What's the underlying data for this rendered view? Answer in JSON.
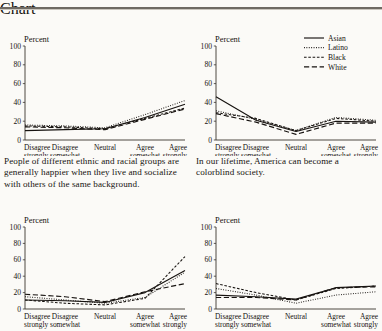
{
  "axis": {
    "y_label": "Percent",
    "y_ticks": [
      0,
      20,
      40,
      60,
      80,
      100
    ],
    "x_ticks": [
      {
        "line1": "Disagree",
        "line2": "strongly"
      },
      {
        "line1": "Disagree",
        "line2": "somewhat"
      },
      {
        "line1": "Neutral",
        "line2": ""
      },
      {
        "line1": "Agree",
        "line2": "somewhat"
      },
      {
        "line1": "Agree",
        "line2": "strongly"
      }
    ]
  },
  "legend": {
    "position": "top-right-panel",
    "entries": [
      {
        "label": "Asian",
        "style": "solid"
      },
      {
        "label": "Latino",
        "style": "dotted"
      },
      {
        "label": "Black",
        "style": "dashed-short"
      },
      {
        "label": "White",
        "style": "dashed-long"
      }
    ]
  },
  "captions": {
    "left": "People of different ethnic and racial groups are generally happier when they live and socialize with others of the same background.",
    "right": "In our lifetime, America can become a colorblind society."
  },
  "chart_data": [
    {
      "type": "line",
      "panel": "top-left",
      "title": "People of different ethnic and racial groups are generally happier when they live and socialize with others of the same background.",
      "xlabel": "",
      "ylabel": "Percent",
      "ylim": [
        0,
        100
      ],
      "grid": false,
      "categories": [
        "Disagree strongly",
        "Disagree somewhat",
        "Neutral",
        "Agree somewhat",
        "Agree strongly"
      ],
      "series": [
        {
          "name": "Asian",
          "values": [
            10,
            11,
            12,
            24,
            38
          ]
        },
        {
          "name": "Latino",
          "values": [
            16,
            15,
            13,
            27,
            42
          ]
        },
        {
          "name": "Black",
          "values": [
            15,
            14,
            12,
            23,
            34
          ]
        },
        {
          "name": "White",
          "values": [
            14,
            13,
            11,
            22,
            33
          ]
        }
      ]
    },
    {
      "type": "line",
      "panel": "top-right",
      "title": "In our lifetime, America can become a colorblind society.",
      "xlabel": "",
      "ylabel": "Percent",
      "ylim": [
        0,
        100
      ],
      "grid": false,
      "categories": [
        "Disagree strongly",
        "Disagree somewhat",
        "Neutral",
        "Agree somewhat",
        "Agree strongly"
      ],
      "series": [
        {
          "name": "Asian",
          "values": [
            46,
            21,
            9,
            20,
            19
          ]
        },
        {
          "name": "Latino",
          "values": [
            31,
            22,
            10,
            24,
            21
          ]
        },
        {
          "name": "Black",
          "values": [
            29,
            23,
            10,
            23,
            20
          ]
        },
        {
          "name": "White",
          "values": [
            28,
            19,
            6,
            18,
            18
          ]
        }
      ]
    },
    {
      "type": "line",
      "panel": "bottom-left",
      "title": "",
      "xlabel": "",
      "ylabel": "Percent",
      "ylim": [
        0,
        100
      ],
      "grid": false,
      "categories": [
        "Disagree strongly",
        "Disagree somewhat",
        "Neutral",
        "Agree somewhat",
        "Agree strongly"
      ],
      "series": [
        {
          "name": "Asian",
          "values": [
            11,
            10,
            8,
            20,
            47
          ]
        },
        {
          "name": "Latino",
          "values": [
            15,
            11,
            7,
            14,
            45
          ]
        },
        {
          "name": "Black",
          "values": [
            11,
            7,
            5,
            13,
            64
          ]
        },
        {
          "name": "White",
          "values": [
            18,
            15,
            9,
            21,
            31
          ]
        }
      ]
    },
    {
      "type": "line",
      "panel": "bottom-right",
      "title": "",
      "xlabel": "",
      "ylabel": "Percent",
      "ylim": [
        0,
        100
      ],
      "grid": false,
      "categories": [
        "Disagree strongly",
        "Disagree somewhat",
        "Neutral",
        "Agree somewhat",
        "Agree strongly"
      ],
      "series": [
        {
          "name": "Asian",
          "values": [
            17,
            15,
            12,
            26,
            28
          ]
        },
        {
          "name": "Latino",
          "values": [
            25,
            17,
            7,
            17,
            21
          ]
        },
        {
          "name": "Black",
          "values": [
            31,
            20,
            11,
            25,
            28
          ]
        },
        {
          "name": "White",
          "values": [
            14,
            14,
            11,
            26,
            27
          ]
        }
      ]
    }
  ]
}
